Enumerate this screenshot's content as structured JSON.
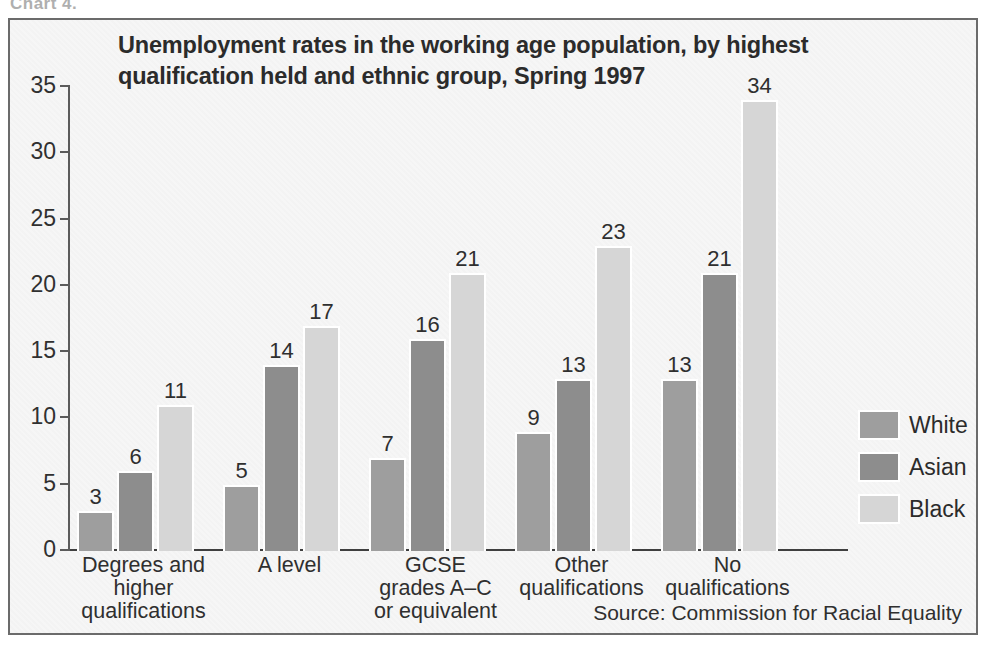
{
  "caption_strip": "Chart 4.",
  "chart_data": {
    "type": "bar",
    "title": "Unemployment rates in the working age population, by highest qualification held and ethnic group, Spring 1997",
    "xlabel": "",
    "ylabel": "",
    "ylim": [
      0,
      35
    ],
    "yticks": [
      0,
      5,
      10,
      15,
      20,
      25,
      30,
      35
    ],
    "grid": false,
    "legend_position": "right",
    "source": "Source: Commission for Racial Equality",
    "categories": [
      "Degrees and\nhigher\nqualifications",
      "A level",
      "GCSE\ngrades A–C\nor equivalent",
      "Other\nqualifications",
      "No\nqualifications"
    ],
    "series": [
      {
        "name": "White",
        "color": "#9e9e9e",
        "values": [
          3,
          5,
          7,
          9,
          13
        ]
      },
      {
        "name": "Asian",
        "color": "#8d8d8d",
        "values": [
          6,
          14,
          16,
          13,
          21
        ]
      },
      {
        "name": "Black",
        "color": "#d6d6d6",
        "values": [
          11,
          17,
          21,
          23,
          34
        ]
      }
    ]
  }
}
